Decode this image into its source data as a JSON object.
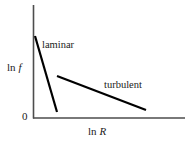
{
  "figure": {
    "name": "friction-factor-vs-reynolds-number-log-log-plot",
    "background_color": "#ffffff",
    "line_color": "#000000",
    "axis_color": "#4d4d4d"
  },
  "axes": {
    "y_label_prefix": "ln",
    "y_label_symbol": "f",
    "x_label_prefix": "ln",
    "x_label_symbol": "R",
    "origin_tick_label": "0",
    "x_axis": {
      "start_px": 33,
      "end_px": 185,
      "y_px": 118
    },
    "y_axis": {
      "x_px": 33,
      "top_px": 5,
      "bottom_px": 118
    }
  },
  "annotations": [
    {
      "id": "laminar",
      "label": "laminar"
    },
    {
      "id": "turbulent",
      "label": "turbulent"
    }
  ],
  "chart_data": {
    "type": "line",
    "title": "",
    "xlabel": "ln R",
    "ylabel": "ln f",
    "grid": false,
    "legend": "inline-annotations",
    "xlim": [
      0,
      1
    ],
    "ylim": [
      0,
      1
    ],
    "axis_tick_labels": {
      "x": [],
      "y": [
        "0"
      ]
    },
    "series": [
      {
        "name": "laminar",
        "label": "laminar",
        "color": "#000000",
        "width_px": 2.2,
        "points_px": [
          [
            35,
            36
          ],
          [
            57,
            112
          ]
        ],
        "description": "steeply descending straight segment at low Reynolds number"
      },
      {
        "name": "turbulent",
        "label": "turbulent",
        "color": "#000000",
        "width_px": 2.2,
        "points_px": [
          [
            57,
            76
          ],
          [
            146,
            110
          ]
        ],
        "description": "gently descending straight segment at high Reynolds number"
      }
    ]
  }
}
